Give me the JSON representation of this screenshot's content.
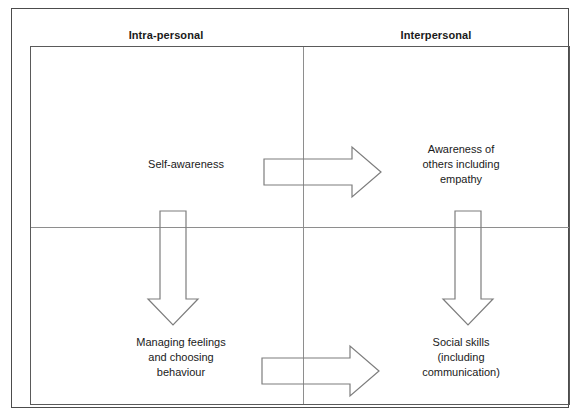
{
  "figure": {
    "name": "emotional-intelligence-quadrant-diagram",
    "columns": [
      {
        "id": "intra-personal",
        "label": "Intra-personal"
      },
      {
        "id": "interpersonal",
        "label": "Interpersonal"
      }
    ],
    "quadrants": [
      {
        "id": "top-left",
        "text": "Self-awareness"
      },
      {
        "id": "top-right",
        "text": "Awareness of\nothers including\nempathy"
      },
      {
        "id": "bottom-left",
        "text": "Managing feelings\nand choosing\nbehaviour"
      },
      {
        "id": "bottom-right",
        "text": "Social skills\n(including\ncommunication)"
      }
    ],
    "arrows": [
      {
        "id": "self-awareness-to-awareness-of-others",
        "direction": "right"
      },
      {
        "id": "self-awareness-to-managing-feelings",
        "direction": "down"
      },
      {
        "id": "awareness-of-others-to-social-skills",
        "direction": "down"
      },
      {
        "id": "managing-feelings-to-social-skills",
        "direction": "right"
      }
    ],
    "colors": {
      "frame": "#4c4c4c",
      "matrix_border": "#5a5a5a",
      "divider": "#8e8e8e",
      "arrow_stroke": "#7d7d7d",
      "text": "#1a1a1a",
      "background": "#ffffff"
    }
  }
}
